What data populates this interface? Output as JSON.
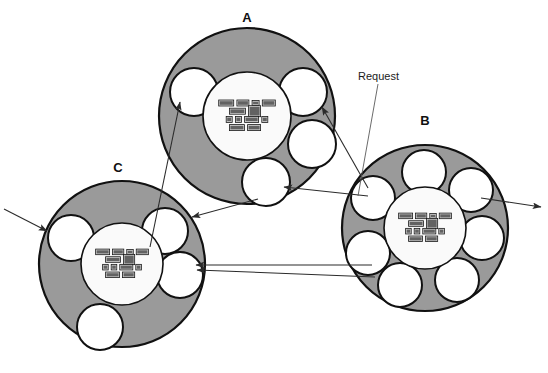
{
  "diagram": {
    "background_color": "#ffffff",
    "ring_fill_color": "#9a9a9a",
    "core_fill_color": "#fafafa",
    "satellite_fill_color": "#ffffff",
    "stroke_color": "#111111",
    "arrow_color": "#2b2b2b"
  },
  "annotations": [
    {
      "id": "request",
      "label": "Request"
    }
  ],
  "nodes": [
    {
      "id": "A",
      "label": "A",
      "label_x": 247,
      "label_y": 22,
      "cx": 247,
      "cy": 116,
      "ring_radius": 88,
      "core_radius": 44,
      "satellite_count": 4,
      "satellites": [
        {
          "cx": 194,
          "cy": 92,
          "r": 24
        },
        {
          "cx": 303,
          "cy": 92,
          "r": 24
        },
        {
          "cx": 312,
          "cy": 144,
          "r": 24
        },
        {
          "cx": 266,
          "cy": 182,
          "r": 24
        }
      ]
    },
    {
      "id": "B",
      "label": "B",
      "label_x": 425,
      "label_y": 125,
      "cx": 425,
      "cy": 228,
      "ring_radius": 83,
      "core_radius": 41,
      "satellite_count": 7,
      "satellites": [
        {
          "cx": 424,
          "cy": 172,
          "r": 22
        },
        {
          "cx": 471,
          "cy": 190,
          "r": 22
        },
        {
          "cx": 482,
          "cy": 238,
          "r": 22
        },
        {
          "cx": 457,
          "cy": 280,
          "r": 22
        },
        {
          "cx": 400,
          "cy": 285,
          "r": 22
        },
        {
          "cx": 368,
          "cy": 253,
          "r": 22
        },
        {
          "cx": 373,
          "cy": 198,
          "r": 22
        }
      ]
    },
    {
      "id": "C",
      "label": "C",
      "label_x": 118,
      "label_y": 172,
      "cx": 122,
      "cy": 264,
      "ring_radius": 83,
      "core_radius": 41,
      "satellite_count": 4,
      "satellites": [
        {
          "cx": 71,
          "cy": 238,
          "r": 23
        },
        {
          "cx": 165,
          "cy": 231,
          "r": 23
        },
        {
          "cx": 180,
          "cy": 275,
          "r": 23
        },
        {
          "cx": 100,
          "cy": 327,
          "r": 23
        }
      ]
    }
  ],
  "core_boxes": {
    "rows": [
      {
        "boxes": [
          {
            "text": "14.3",
            "w": 15,
            "h": 6
          },
          {
            "text": "abc",
            "w": 12,
            "h": 6
          },
          {
            "text": "",
            "w": 7,
            "h": 5
          },
          {
            "text": "11m",
            "w": 13,
            "h": 6
          }
        ]
      },
      {
        "boxes": [
          {
            "text": "30;42",
            "w": 16,
            "h": 6
          },
          {
            "text": "cfx pdq",
            "w": 12,
            "h": 11
          }
        ]
      },
      {
        "boxes": [
          {
            "text": "0",
            "w": 6,
            "h": 6
          },
          {
            "text": "8",
            "w": 6,
            "h": 6
          },
          {
            "text": "x.1.8",
            "w": 14,
            "h": 6
          },
          {
            "text": "0",
            "w": 6,
            "h": 6
          }
        ]
      },
      {
        "boxes": [
          {
            "text": "-1.19",
            "w": 15,
            "h": 6
          },
          {
            "text": "mm",
            "w": 13,
            "h": 6
          }
        ]
      }
    ]
  },
  "connections": [
    {
      "id": "external-in-C",
      "from": "outside-left",
      "to": "C-satellite-left",
      "kind": "arrow"
    },
    {
      "id": "external-out-B",
      "from": "B-ring-right",
      "to": "outside-right",
      "kind": "arrow"
    },
    {
      "id": "C-to-A",
      "from": "C-satellite-top",
      "to": "A-satellite-upper-left",
      "kind": "arrow"
    },
    {
      "id": "B-to-A-right",
      "from": "B-satellite-upper-left",
      "to": "A-satellite-right",
      "kind": "arrow"
    },
    {
      "id": "B-to-A-bottom",
      "from": "B-satellite-upper-left",
      "to": "A-satellite-bottom",
      "kind": "arrow"
    },
    {
      "id": "A-to-C",
      "from": "A-satellite-bottom",
      "to": "C-satellite-top-right",
      "kind": "arrow"
    },
    {
      "id": "B-to-C-pair-1",
      "from": "B-satellite-lower-left",
      "to": "C-satellite-right",
      "kind": "arrow"
    },
    {
      "id": "B-to-C-pair-2",
      "from": "B-satellite-lower-left",
      "to": "C-satellite-right",
      "kind": "arrow"
    },
    {
      "id": "request-leader",
      "from": "request-label",
      "to": "B-satellite-upper-left",
      "kind": "leader"
    }
  ]
}
